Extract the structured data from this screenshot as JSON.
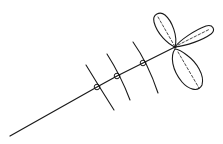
{
  "figure": {
    "stroke_color": "#1a1a1a",
    "background": "#ffffff",
    "stem": {
      "start": [
        10,
        136
      ],
      "end": [
        175,
        47
      ]
    },
    "nodes": [
      {
        "x": 97,
        "y": 87
      },
      {
        "x": 117,
        "y": 76
      },
      {
        "x": 143,
        "y": 63
      }
    ],
    "leaflets": [
      "upper",
      "right",
      "lower"
    ]
  }
}
